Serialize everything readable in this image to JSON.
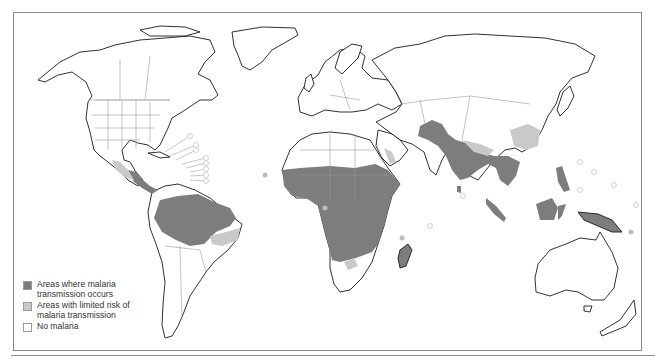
{
  "map": {
    "title": "",
    "subject": "Global malaria distribution",
    "colors": {
      "transmission": "#7d7d7d",
      "limited_risk": "#c9c9c9",
      "no_malaria": "#ffffff",
      "coastline": "#1a1a1a",
      "borders": "#9a9a9a"
    },
    "legend": {
      "items": [
        {
          "label": "Areas where malaria transmission occurs",
          "swatch": "#7d7d7d"
        },
        {
          "label": "Areas with limited risk of malaria transmission",
          "swatch": "#c9c9c9"
        },
        {
          "label": "No malaria",
          "swatch": "#ffffff"
        }
      ]
    },
    "regions": {
      "transmission": [
        "Central America",
        "Amazon basin",
        "Sub-Saharan Africa",
        "Madagascar",
        "South Asia",
        "Southeast Asia",
        "Indonesia",
        "Papua New Guinea"
      ],
      "limited_risk": [
        "Mexico",
        "Southern Brazil margin",
        "Southern Africa margin",
        "Eastern China",
        "Arabian coast",
        "Himalayan foothills"
      ],
      "no_malaria": [
        "North America",
        "Europe",
        "Russia",
        "Australia",
        "New Zealand",
        "Southern South America"
      ]
    }
  }
}
